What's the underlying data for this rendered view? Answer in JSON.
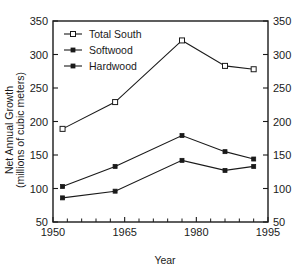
{
  "chart_data": {
    "type": "line",
    "title": "",
    "xlabel": "Year",
    "ylabel": "Net Annual Growth (millions of cubic meters)",
    "ylabel_line1": "Net Annual Growth",
    "ylabel_line2": "(millions of cubic meters)",
    "xlim": [
      1950,
      1995
    ],
    "ylim": [
      50,
      350
    ],
    "x_ticks": [
      1950,
      1965,
      1980,
      1995
    ],
    "x_tick_labels": [
      "1950",
      "1965",
      "1980",
      "1995"
    ],
    "x_minor_ticks": [
      1953,
      1956,
      1959,
      1962,
      1968,
      1971,
      1974,
      1977,
      1983,
      1986,
      1989,
      1992
    ],
    "y_ticks": [
      50,
      100,
      150,
      200,
      250,
      300,
      350
    ],
    "y_tick_labels": [
      "50",
      "100",
      "150",
      "200",
      "250",
      "300",
      "350"
    ],
    "y_axis_right_labels": [
      "50",
      "100",
      "150",
      "200",
      "250",
      "300",
      "350"
    ],
    "grid": false,
    "legend_position": "upper left",
    "x": [
      1952,
      1963,
      1977,
      1986,
      1992
    ],
    "series": [
      {
        "name": "Total South",
        "marker": "open-square",
        "values": [
          189,
          229,
          321,
          283,
          278
        ]
      },
      {
        "name": "Softwood",
        "marker": "filled-square",
        "values": [
          103,
          133,
          179,
          155,
          144
        ]
      },
      {
        "name": "Hardwood",
        "marker": "filled-square",
        "values": [
          86,
          96,
          142,
          127,
          133
        ]
      }
    ]
  },
  "colors": {
    "axis": "#1a1a1a",
    "line": "#1a1a1a",
    "background": "#ffffff"
  }
}
